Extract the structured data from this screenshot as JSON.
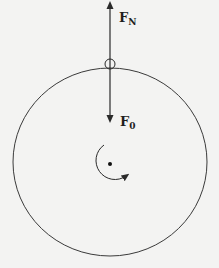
{
  "diagram": {
    "title": "",
    "colors": {
      "background": "#f3f3f2",
      "stroke": "#2a2a2a",
      "text": "#1e1e1e"
    },
    "body": {
      "shape": "circle",
      "center": [
        110,
        162
      ],
      "radius": 95,
      "center_point": true
    },
    "contact_point": {
      "shape": "small-circle",
      "center": [
        110,
        64
      ],
      "radius": 5
    },
    "forces": [
      {
        "id": "normal-force",
        "symbol": "F",
        "subscript": "N",
        "direction": "up",
        "from": [
          110,
          64
        ],
        "to": [
          110,
          3
        ]
      },
      {
        "id": "applied-force",
        "symbol": "F",
        "subscript": "0",
        "direction": "down",
        "from": [
          110,
          64
        ],
        "to": [
          110,
          121
        ]
      }
    ],
    "rotation": {
      "indicator": "curved-arrow",
      "sense": "counterclockwise",
      "around": [
        110,
        163
      ]
    }
  }
}
